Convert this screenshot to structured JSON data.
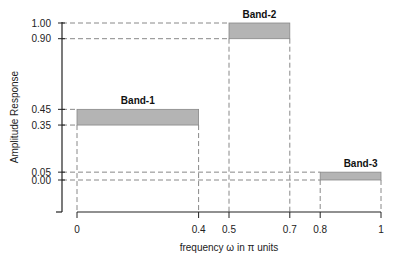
{
  "chart_data": {
    "type": "bar",
    "title": "",
    "xlabel": "frequency ω in π units",
    "ylabel": "Amplitude Response",
    "xlim": [
      0,
      1
    ],
    "ylim": [
      -0.2,
      1.0
    ],
    "grid": false,
    "x_ticks": [
      "0",
      "0.4",
      "0.5",
      "0.7",
      "0.8",
      "1"
    ],
    "x_tick_values": [
      0,
      0.4,
      0.5,
      0.7,
      0.8,
      1
    ],
    "y_ticks": [
      "1.00",
      "0.90",
      "0.45",
      "0.35",
      "0.05",
      "0.00"
    ],
    "y_tick_values": [
      1.0,
      0.9,
      0.45,
      0.35,
      0.05,
      0.0
    ],
    "bands": [
      {
        "name": "Band-1",
        "x_start": 0.0,
        "x_end": 0.4,
        "y_low": 0.35,
        "y_high": 0.45
      },
      {
        "name": "Band-2",
        "x_start": 0.5,
        "x_end": 0.7,
        "y_low": 0.9,
        "y_high": 1.0
      },
      {
        "name": "Band-3",
        "x_start": 0.8,
        "x_end": 1.0,
        "y_low": 0.0,
        "y_high": 0.05
      }
    ],
    "colors": {
      "band_fill": "#b4b4b4",
      "band_edge": "#888888",
      "axis": "#222222",
      "dashed": "#888888"
    }
  }
}
